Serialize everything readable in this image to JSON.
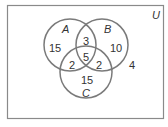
{
  "diagram": {
    "universe_label": "U",
    "sets": [
      {
        "name": "A",
        "label": "A"
      },
      {
        "name": "B",
        "label": "B"
      },
      {
        "name": "C",
        "label": "C"
      }
    ],
    "regions": {
      "a_only": "15",
      "b_only": "10",
      "c_only": "15",
      "ab_only": "3",
      "ac_only": "2",
      "bc_only": "2",
      "abc": "5",
      "outside": "4"
    },
    "colors": {
      "stroke": "#7a7a7a",
      "text": "#333333",
      "background": "#ffffff"
    }
  }
}
